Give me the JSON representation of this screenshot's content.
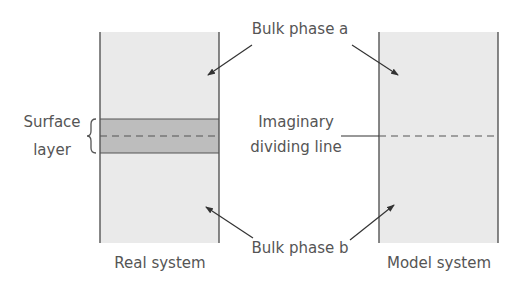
{
  "colors": {
    "bulk_fill": "#eaeaea",
    "surface_fill": "#bdbdbd",
    "line": "#555555",
    "text": "#555555"
  },
  "labels": {
    "bulk_phase_a": "Bulk phase a",
    "bulk_phase_b": "Bulk phase b",
    "surface_line1": "Surface",
    "surface_line2": "layer",
    "imaginary_line1": "Imaginary",
    "imaginary_line2": "dividing line",
    "real_system": "Real system",
    "model_system": "Model system"
  },
  "real_system": {
    "box": {
      "x": 100,
      "y": 32,
      "width": 119,
      "height": 211
    },
    "surface_layer": {
      "y_top": 119,
      "y_bottom": 153,
      "dashed_y": 136
    }
  },
  "model_system": {
    "box": {
      "x": 379,
      "y": 32,
      "width": 119,
      "height": 211
    },
    "dashed_y": 136
  },
  "arrows": [
    {
      "name": "arrow-phase-a-real",
      "x1": 252,
      "y1": 45,
      "x2": 208,
      "y2": 75
    },
    {
      "name": "arrow-phase-a-model",
      "x1": 352,
      "y1": 45,
      "x2": 398,
      "y2": 75
    },
    {
      "name": "arrow-phase-b-real",
      "x1": 253,
      "y1": 238,
      "x2": 206,
      "y2": 207
    },
    {
      "name": "arrow-phase-b-model",
      "x1": 350,
      "y1": 240,
      "x2": 394,
      "y2": 205
    }
  ],
  "pointer_line": {
    "x1": 341,
    "x2": 379,
    "y": 136
  }
}
